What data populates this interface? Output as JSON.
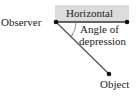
{
  "diagram": {
    "labels": {
      "observer": "Observer",
      "horizontal": "Horizontal",
      "angle_line1": "Angle of",
      "angle_line2": "depression",
      "object": "Object"
    },
    "colors": {
      "horizontal_band": "#dcdcdc",
      "line": "#333333",
      "dot": "#111111",
      "text": "#222222"
    }
  }
}
